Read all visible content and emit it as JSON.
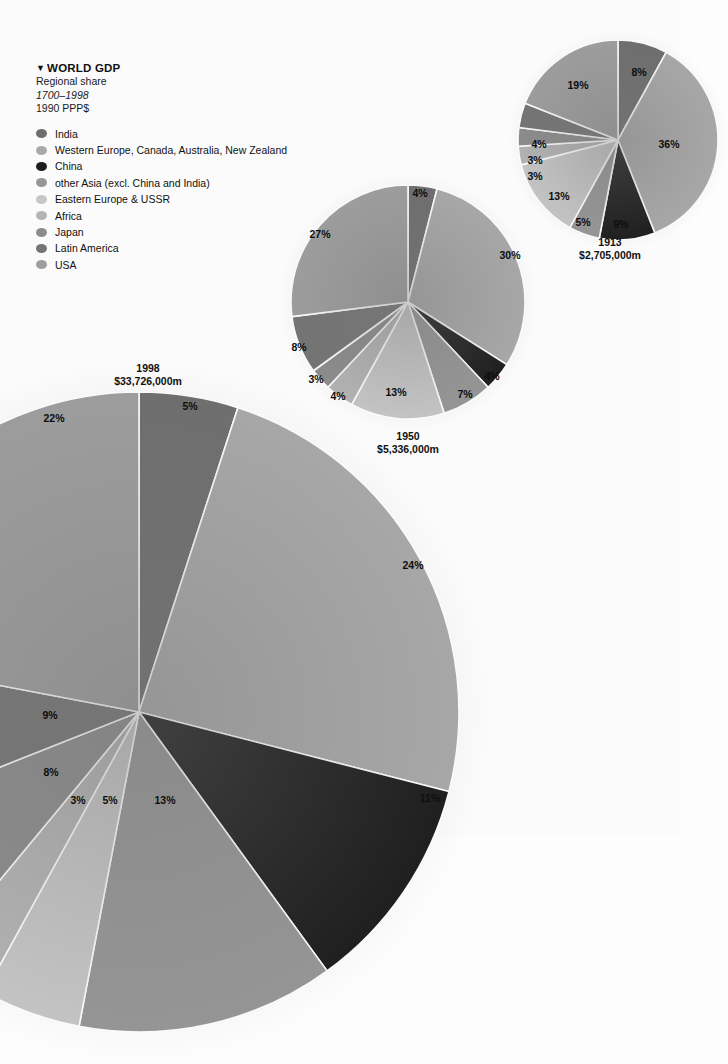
{
  "legend": {
    "title": "WORLD GDP",
    "marker": "▼",
    "subtitle": "Regional share",
    "period": "1700–1998",
    "units": "1990 PPP$",
    "items": [
      {
        "label": "India",
        "color": "#6e6e6e"
      },
      {
        "label": "Western Europe, Canada, Australia, New Zealand",
        "color": "#a9a9a9"
      },
      {
        "label": "China",
        "color": "#1c1c1c"
      },
      {
        "label": "other Asia (excl. China and India)",
        "color": "#969696"
      },
      {
        "label": "Eastern Europe & USSR",
        "color": "#c6c6c6"
      },
      {
        "label": "Africa",
        "color": "#b4b4b4"
      },
      {
        "label": "Japan",
        "color": "#8c8c8c"
      },
      {
        "label": "Latin America",
        "color": "#747474"
      },
      {
        "label": "USA",
        "color": "#9e9e9e"
      }
    ]
  },
  "chart_data": {
    "type": "pie",
    "title": "WORLD GDP",
    "subtitle": "Regional share",
    "period": "1700–1998",
    "units": "1990 PPP$",
    "categories": [
      "India",
      "Western Europe, Canada, Australia, New Zealand",
      "China",
      "other Asia (excl. China and India)",
      "Eastern Europe & USSR",
      "Africa",
      "Japan",
      "Latin America",
      "USA"
    ],
    "colors": [
      "#6e6e6e",
      "#a9a9a9",
      "#1c1c1c",
      "#969696",
      "#c6c6c6",
      "#b4b4b4",
      "#8c8c8c",
      "#747474",
      "#9e9e9e"
    ],
    "series": [
      {
        "name": "1913",
        "year": "1913",
        "total_label": "$2,705,000m",
        "values": [
          8,
          36,
          9,
          5,
          13,
          3,
          3,
          4,
          19
        ],
        "labels": [
          "8%",
          "36%",
          "9%",
          "5%",
          "13%",
          "3%",
          "3%",
          "4%",
          "19%"
        ]
      },
      {
        "name": "1950",
        "year": "1950",
        "total_label": "$5,336,000m",
        "values": [
          4,
          30,
          4,
          7,
          13,
          4,
          3,
          8,
          27
        ],
        "labels": [
          "4%",
          "30%",
          "4%",
          "7%",
          "13%",
          "4%",
          "3%",
          "8%",
          "27%"
        ]
      },
      {
        "name": "1998",
        "year": "1998",
        "total_label": "$33,726,000m",
        "values": [
          5,
          24,
          11,
          13,
          5,
          3,
          8,
          9,
          22
        ],
        "labels": [
          "5%",
          "24%",
          "11%",
          "13%",
          "5%",
          "3%",
          "8%",
          "9%",
          "22%"
        ]
      }
    ],
    "legend_position": "top-left",
    "grid": false
  },
  "pies": {
    "p1913": {
      "year": "1913",
      "total": "$2,705,000m",
      "cx": 618,
      "cy": 140,
      "r": 100,
      "caption_x": 610,
      "caption_y": 236,
      "labels": [
        {
          "text": "8%",
          "x": 639,
          "y": 72
        },
        {
          "text": "36%",
          "x": 669,
          "y": 144
        },
        {
          "text": "9%",
          "x": 621,
          "y": 224
        },
        {
          "text": "5%",
          "x": 583,
          "y": 222
        },
        {
          "text": "13%",
          "x": 559,
          "y": 196
        },
        {
          "text": "3%",
          "x": 535,
          "y": 176
        },
        {
          "text": "3%",
          "x": 535,
          "y": 160
        },
        {
          "text": "4%",
          "x": 539,
          "y": 144
        },
        {
          "text": "19%",
          "x": 578,
          "y": 85
        }
      ]
    },
    "p1950": {
      "year": "1950",
      "total": "$5,336,000m",
      "cx": 408,
      "cy": 302,
      "r": 117,
      "caption_x": 408,
      "caption_y": 430,
      "labels": [
        {
          "text": "4%",
          "x": 420,
          "y": 193
        },
        {
          "text": "30%",
          "x": 510,
          "y": 255
        },
        {
          "text": "4%",
          "x": 492,
          "y": 376
        },
        {
          "text": "7%",
          "x": 465,
          "y": 394
        },
        {
          "text": "13%",
          "x": 396,
          "y": 392
        },
        {
          "text": "4%",
          "x": 338,
          "y": 396
        },
        {
          "text": "3%",
          "x": 316,
          "y": 379
        },
        {
          "text": "8%",
          "x": 299,
          "y": 347
        },
        {
          "text": "27%",
          "x": 320,
          "y": 234
        }
      ]
    },
    "p1998": {
      "year": "1998",
      "total": "$33,726,000m",
      "cx": 139,
      "cy": 712,
      "r": 320,
      "caption_x": 148,
      "caption_y": 362,
      "labels": [
        {
          "text": "5%",
          "x": 190,
          "y": 406
        },
        {
          "text": "24%",
          "x": 413,
          "y": 565
        },
        {
          "text": "11%",
          "x": 430,
          "y": 798
        },
        {
          "text": "13%",
          "x": 165,
          "y": 800
        },
        {
          "text": "5%",
          "x": 110,
          "y": 800
        },
        {
          "text": "3%",
          "x": 78,
          "y": 800
        },
        {
          "text": "8%",
          "x": 51,
          "y": 772
        },
        {
          "text": "9%",
          "x": 50,
          "y": 715
        },
        {
          "text": "22%",
          "x": 54,
          "y": 418
        }
      ]
    }
  }
}
